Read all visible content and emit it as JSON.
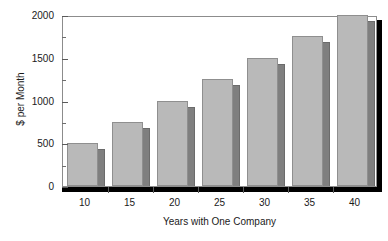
{
  "chart_data": {
    "type": "bar",
    "title": "",
    "subtitle": "",
    "xlabel": "Years with One Company",
    "ylabel": "$ per Month",
    "categories": [
      "10",
      "15",
      "20",
      "25",
      "30",
      "35",
      "40"
    ],
    "values": [
      500,
      750,
      1000,
      1250,
      1500,
      1750,
      2000
    ],
    "series": [
      {
        "name": "",
        "values": [
          500,
          750,
          1000,
          1250,
          1500,
          1750,
          2000
        ]
      }
    ],
    "ylim": [
      0,
      2000
    ],
    "y_major_ticks": [
      0,
      500,
      1000,
      1500,
      2000
    ],
    "y_major_tick_labels": [
      "0",
      "500",
      "1000",
      "1500",
      "2000"
    ],
    "y_minor_ticks": [
      250,
      750,
      1250,
      1750
    ],
    "grid": false,
    "legend": false,
    "legend_position": "none",
    "style": "3d-shaded-bars",
    "colors": {
      "bar_face": "#b9b9b9",
      "bar_side": "#7f7f7f",
      "bar_edge": "#8f8f8f",
      "axis": "#8c8c8c",
      "shadow": "#000000",
      "text": "#1a1a1a",
      "background": "#ffffff"
    }
  }
}
